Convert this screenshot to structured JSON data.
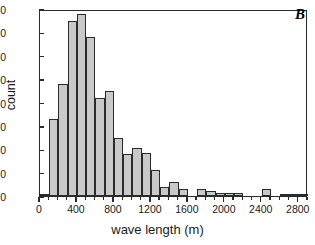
{
  "panel": {
    "letter": "B"
  },
  "chart_data": {
    "type": "bar",
    "title": "",
    "subtitle": "",
    "xlabel": "wave length (m)",
    "ylabel": "count",
    "xlim": [
      0,
      2900
    ],
    "ylim": [
      0,
      80
    ],
    "bin_width": 100,
    "grid": false,
    "legend": null,
    "xticks": [
      0,
      400,
      800,
      1200,
      1600,
      2000,
      2400,
      2800
    ],
    "xtick_labels": [
      "0",
      "400",
      "800",
      "1200",
      "1600",
      "2000",
      "2400",
      "2800"
    ],
    "xminor_tick_step": 100,
    "yticks": [
      0,
      10,
      20,
      30,
      40,
      50,
      60,
      70,
      80
    ],
    "ytick_labels": [
      "0",
      "10",
      "20",
      "30",
      "40",
      "50",
      "60",
      "70",
      "80"
    ],
    "bar_fill_color": "#c9c9c9",
    "bar_edge_color": "#2b2b2b",
    "categories": [
      "0-100",
      "100-200",
      "200-300",
      "300-400",
      "400-500",
      "500-600",
      "600-700",
      "700-800",
      "800-900",
      "900-1000",
      "1000-1100",
      "1100-1200",
      "1200-1300",
      "1300-1400",
      "1400-1500",
      "1500-1600",
      "1600-1700",
      "1700-1800",
      "1800-1900",
      "1900-2000",
      "2000-2100",
      "2100-2200",
      "2200-2300",
      "2300-2400",
      "2400-2500",
      "2500-2600",
      "2600-2700",
      "2700-2800",
      "2800-2900"
    ],
    "bin_starts": [
      0,
      100,
      200,
      300,
      400,
      500,
      600,
      700,
      800,
      900,
      1000,
      1100,
      1200,
      1300,
      1400,
      1500,
      1600,
      1700,
      1800,
      1900,
      2000,
      2100,
      2200,
      2300,
      2400,
      2500,
      2600,
      2700,
      2800
    ],
    "values": [
      1,
      33,
      48,
      75,
      78,
      68,
      42,
      45,
      25,
      18,
      20.5,
      18.5,
      11,
      4,
      6,
      3,
      0,
      3,
      2,
      1.5,
      1.5,
      1.5,
      0,
      0,
      3,
      0,
      1,
      1,
      1
    ]
  }
}
